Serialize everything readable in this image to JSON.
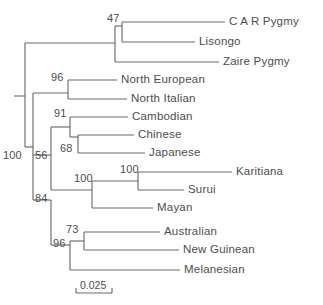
{
  "figure": {
    "type": "phylogenetic-tree",
    "title": "",
    "line_color": "#6b6b6b",
    "text_color": "#4d4d4d",
    "background": "#ffffff"
  },
  "scale": {
    "label": "0.025",
    "x1": 76,
    "x2": 112,
    "y": 293
  },
  "tips": [
    {
      "id": "car-pygmy",
      "label": "C A R Pygmy",
      "y": 22,
      "branch_x1": 122,
      "branch_x2": 225,
      "label_x": 229
    },
    {
      "id": "lisongo",
      "label": "Lisongo",
      "y": 42,
      "branch_x1": 122,
      "branch_x2": 195,
      "label_x": 199
    },
    {
      "id": "zaire-pygmy",
      "label": "Zaire Pygmy",
      "y": 62,
      "branch_x1": 115,
      "branch_x2": 219,
      "label_x": 223
    },
    {
      "id": "north-european",
      "label": "North European",
      "y": 80,
      "branch_x1": 68,
      "branch_x2": 117,
      "label_x": 121
    },
    {
      "id": "north-italian",
      "label": "North Italian",
      "y": 99,
      "branch_x1": 68,
      "branch_x2": 127,
      "label_x": 131
    },
    {
      "id": "cambodian",
      "label": "Cambodian",
      "y": 117,
      "branch_x1": 70,
      "branch_x2": 128,
      "label_x": 132
    },
    {
      "id": "chinese",
      "label": "Chinese",
      "y": 135,
      "branch_x1": 78,
      "branch_x2": 134,
      "label_x": 138
    },
    {
      "id": "japanese",
      "label": "Japanese",
      "y": 153,
      "branch_x1": 78,
      "branch_x2": 145,
      "label_x": 149
    },
    {
      "id": "karitiana",
      "label": "Karitiana",
      "y": 172,
      "branch_x1": 138,
      "branch_x2": 232,
      "label_x": 236
    },
    {
      "id": "surui",
      "label": "Surui",
      "y": 190,
      "branch_x1": 138,
      "branch_x2": 184,
      "label_x": 188
    },
    {
      "id": "mayan",
      "label": "Mayan",
      "y": 208,
      "branch_x1": 92,
      "branch_x2": 153,
      "label_x": 157
    },
    {
      "id": "australian",
      "label": "Australian",
      "y": 232,
      "branch_x1": 84,
      "branch_x2": 160,
      "label_x": 164
    },
    {
      "id": "new-guinean",
      "label": "New Guinean",
      "y": 250,
      "branch_x1": 84,
      "branch_x2": 179,
      "label_x": 183
    },
    {
      "id": "melanesian",
      "label": "Melanesian",
      "y": 270,
      "branch_x1": 70,
      "branch_x2": 180,
      "label_x": 184
    }
  ],
  "nodes": [
    {
      "id": "node-root",
      "support": "",
      "x": 25,
      "y_top": 43,
      "y_bot": 147,
      "parent_x": 14,
      "parent_y": 96,
      "label_x": 0,
      "label_y": 0
    },
    {
      "id": "node-african",
      "support": "",
      "x": 115,
      "y_top": 26,
      "y_bot": 62,
      "parent_x": 25,
      "parent_y": 43,
      "label_x": 0,
      "label_y": 0
    },
    {
      "id": "node-car-lisongo",
      "support": "47",
      "x": 122,
      "y_top": 22,
      "y_bot": 42,
      "parent_x": 115,
      "parent_y": 26,
      "label_x": 107,
      "label_y": 13
    },
    {
      "id": "node-eurasian",
      "support": "100",
      "x": 33,
      "y_top": 93,
      "y_bot": 200,
      "parent_x": 25,
      "parent_y": 147,
      "label_x": 3,
      "label_y": 150
    },
    {
      "id": "node-european",
      "support": "96",
      "x": 68,
      "y_top": 80,
      "y_bot": 99,
      "parent_x": 33,
      "parent_y": 93,
      "label_x": 51,
      "label_y": 72
    },
    {
      "id": "node-asian-amerind",
      "support": "56",
      "x": 51,
      "y_top": 127,
      "y_bot": 190,
      "parent_x": 33,
      "parent_y": 155,
      "label_x": 35,
      "label_y": 150
    },
    {
      "id": "node-asian",
      "support": "91",
      "x": 70,
      "y_top": 117,
      "y_bot": 137,
      "parent_x": 51,
      "parent_y": 127,
      "label_x": 54,
      "label_y": 108
    },
    {
      "id": "node-chin-jap",
      "support": "68",
      "x": 78,
      "y_top": 135,
      "y_bot": 153,
      "parent_x": 70,
      "parent_y": 137,
      "label_x": 60,
      "label_y": 143
    },
    {
      "id": "node-amerindian",
      "support": "100",
      "x": 92,
      "y_top": 181,
      "y_bot": 208,
      "parent_x": 51,
      "parent_y": 190,
      "label_x": 74,
      "label_y": 173
    },
    {
      "id": "node-kari-surui",
      "support": "100",
      "x": 138,
      "y_top": 172,
      "y_bot": 190,
      "parent_x": 92,
      "parent_y": 181,
      "label_x": 120,
      "label_y": 164
    },
    {
      "id": "node-oceanic",
      "support": "84",
      "x": 51,
      "y_top": 200,
      "y_bot": 245,
      "parent_x": 33,
      "parent_y": 200,
      "label_x": 35,
      "label_y": 193
    },
    {
      "id": "node-melanesian",
      "support": "96",
      "x": 70,
      "y_top": 241,
      "y_bot": 270,
      "parent_x": 51,
      "parent_y": 245,
      "label_x": 53,
      "label_y": 238
    },
    {
      "id": "node-aus-ng",
      "support": "73",
      "x": 84,
      "y_top": 232,
      "y_bot": 250,
      "parent_x": 70,
      "parent_y": 241,
      "label_x": 66,
      "label_y": 224
    }
  ]
}
